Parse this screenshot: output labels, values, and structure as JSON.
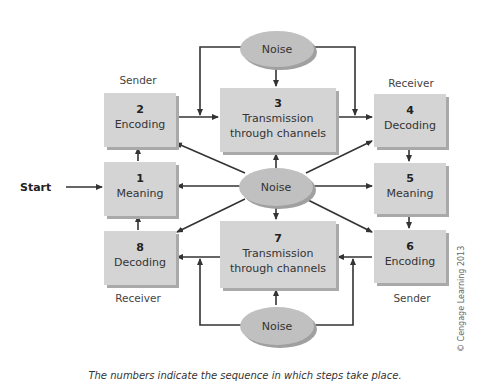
{
  "diagram": {
    "start_label": "Start",
    "boxes": [
      {
        "num": "1",
        "text": "Meaning"
      },
      {
        "num": "2",
        "text": "Encoding"
      },
      {
        "num": "3",
        "line1": "Transmission",
        "line2": "through channels"
      },
      {
        "num": "4",
        "text": "Decoding"
      },
      {
        "num": "5",
        "text": "Meaning"
      },
      {
        "num": "6",
        "text": "Encoding"
      },
      {
        "num": "7",
        "line1": "Transmission",
        "line2": "through channels"
      },
      {
        "num": "8",
        "text": "Decoding"
      }
    ],
    "noise": [
      "Noise",
      "Noise",
      "Noise"
    ],
    "roles": {
      "top_left": "Sender",
      "top_right": "Receiver",
      "bottom_left": "Receiver",
      "bottom_right": "Sender"
    },
    "caption": "The numbers indicate the sequence in which steps take place.",
    "copyright": "© Cengage Learning 2013",
    "colors": {
      "box": "#d4d4d4",
      "box_shadow": "#a9a9a9",
      "ellipse": "#bdbdbd",
      "arrow": "#333333"
    }
  }
}
